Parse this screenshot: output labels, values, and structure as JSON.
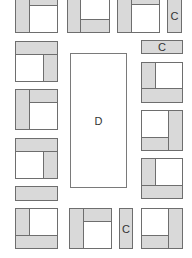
{
  "diagram": {
    "colors": {
      "fill": "#d9d9d9",
      "stroke": "#6e6e6e",
      "background": "#ffffff"
    },
    "labels": {
      "center_table": "D",
      "c_top_right": "C",
      "c_right_bar": "C",
      "c_bottom": "C"
    },
    "units": [
      {
        "id": "L1",
        "x": 15,
        "y": -1,
        "w": 43,
        "h": 34,
        "parts": [
          {
            "x": 0,
            "y": 0,
            "w": 15,
            "h": 34
          },
          {
            "x": 14,
            "y": 0,
            "w": 29,
            "h": 7
          }
        ]
      },
      {
        "id": "T1",
        "x": 67,
        "y": -1,
        "w": 43,
        "h": 34,
        "parts": [
          {
            "x": 0,
            "y": 0,
            "w": 14,
            "h": 34
          },
          {
            "x": 13,
            "y": 20,
            "w": 30,
            "h": 14
          }
        ]
      },
      {
        "id": "T2",
        "x": 117,
        "y": -1,
        "w": 43,
        "h": 34,
        "parts": [
          {
            "x": 0,
            "y": 0,
            "w": 15,
            "h": 34
          },
          {
            "x": 14,
            "y": 0,
            "w": 29,
            "h": 6
          }
        ]
      },
      {
        "id": "L2",
        "x": 15,
        "y": 41,
        "w": 43,
        "h": 41,
        "parts": [
          {
            "x": 0,
            "y": 0,
            "w": 43,
            "h": 14
          },
          {
            "x": 28,
            "y": 13,
            "w": 15,
            "h": 28
          }
        ]
      },
      {
        "id": "L3",
        "x": 15,
        "y": 89,
        "w": 43,
        "h": 41,
        "parts": [
          {
            "x": 0,
            "y": 0,
            "w": 15,
            "h": 41
          },
          {
            "x": 14,
            "y": 0,
            "w": 29,
            "h": 14
          }
        ]
      },
      {
        "id": "L4",
        "x": 15,
        "y": 138,
        "w": 43,
        "h": 41,
        "parts": [
          {
            "x": 0,
            "y": 0,
            "w": 43,
            "h": 14
          },
          {
            "x": 28,
            "y": 13,
            "w": 15,
            "h": 28
          }
        ]
      },
      {
        "id": "L6",
        "x": 15,
        "y": 208,
        "w": 43,
        "h": 41,
        "parts": [
          {
            "x": 0,
            "y": 0,
            "w": 15,
            "h": 41
          },
          {
            "x": 0,
            "y": 27,
            "w": 43,
            "h": 14
          }
        ]
      },
      {
        "id": "R1",
        "x": 141,
        "y": 62,
        "w": 42,
        "h": 41,
        "parts": [
          {
            "x": 0,
            "y": 0,
            "w": 15,
            "h": 41
          },
          {
            "x": 0,
            "y": 26,
            "w": 42,
            "h": 15
          }
        ]
      },
      {
        "id": "R2",
        "x": 141,
        "y": 110,
        "w": 42,
        "h": 41,
        "parts": [
          {
            "x": 27,
            "y": 0,
            "w": 15,
            "h": 41
          },
          {
            "x": 0,
            "y": 27,
            "w": 28,
            "h": 14
          }
        ]
      },
      {
        "id": "R3",
        "x": 141,
        "y": 158,
        "w": 42,
        "h": 41,
        "parts": [
          {
            "x": 0,
            "y": 0,
            "w": 15,
            "h": 41
          },
          {
            "x": 0,
            "y": 27,
            "w": 42,
            "h": 14
          }
        ]
      },
      {
        "id": "R4",
        "x": 141,
        "y": 208,
        "w": 42,
        "h": 41,
        "parts": [
          {
            "x": 27,
            "y": 0,
            "w": 15,
            "h": 41
          },
          {
            "x": 0,
            "y": 27,
            "w": 28,
            "h": 14
          }
        ]
      },
      {
        "id": "B1",
        "x": 69,
        "y": 208,
        "w": 43,
        "h": 41,
        "parts": [
          {
            "x": 0,
            "y": 0,
            "w": 15,
            "h": 41
          },
          {
            "x": 14,
            "y": 0,
            "w": 29,
            "h": 14
          }
        ]
      }
    ]
  }
}
